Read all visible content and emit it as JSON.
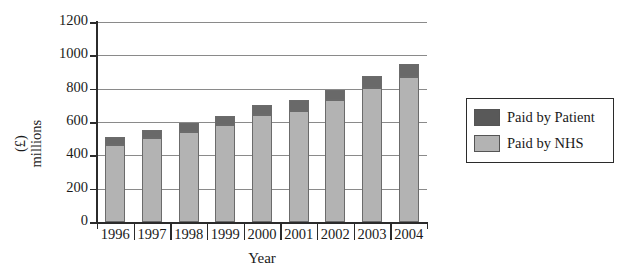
{
  "chart_data": {
    "type": "bar",
    "subtype": "stacked-bar",
    "title": "",
    "xlabel": "Year",
    "ylabel": "(£) millions",
    "ylabel_lines": [
      "(£)",
      "millions"
    ],
    "categories": [
      "1996",
      "1997",
      "1998",
      "1999",
      "2000",
      "2001",
      "2002",
      "2003",
      "2004"
    ],
    "series": [
      {
        "name": "Paid by NHS",
        "color": "#b3b3b3",
        "values": [
          465,
          505,
          540,
          580,
          645,
          665,
          730,
          805,
          870
        ]
      },
      {
        "name": "Paid by Patient",
        "color": "#696969",
        "values": [
          45,
          45,
          55,
          55,
          60,
          65,
          65,
          70,
          80
        ]
      }
    ],
    "totals": [
      510,
      550,
      595,
      635,
      705,
      730,
      795,
      875,
      950
    ],
    "ylim": [
      0,
      1200
    ],
    "yticks": [
      0,
      200,
      400,
      600,
      800,
      1000,
      1200
    ],
    "ytick_labels": [
      "0",
      "200",
      "400",
      "600",
      "800",
      "1000",
      "1200"
    ],
    "grid": true,
    "grid_axis": "y",
    "legend_position": "right",
    "legend_entries": [
      {
        "label": "Paid by Patient",
        "swatch": "#595959"
      },
      {
        "label": "Paid by NHS",
        "swatch": "#b3b3b3"
      }
    ]
  },
  "axes": {
    "x_title": "Year",
    "y_title_line1": "(£)",
    "y_title_line2": "millions"
  },
  "legend": {
    "item_patient": "Paid by Patient",
    "item_nhs": "Paid by NHS"
  },
  "colors": {
    "paid_by_patient": "#696969",
    "paid_by_nhs": "#b3b3b3",
    "axis": "#2b2b2b",
    "gridline": "#8a8a8a",
    "background": "#ffffff"
  }
}
